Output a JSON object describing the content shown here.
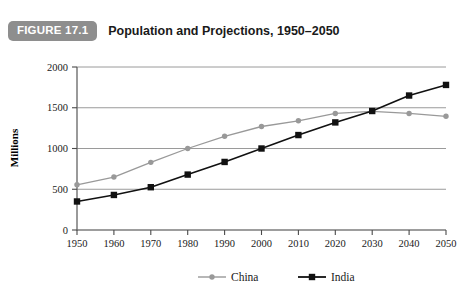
{
  "header": {
    "badge_label": "FIGURE 17.1",
    "title": "Population and Projections, 1950–2050",
    "badge_color": "#8e8e8e",
    "badge_text_color": "#ffffff"
  },
  "chart_data": {
    "type": "line",
    "title": "Population and Projections, 1950–2050",
    "xlabel": "",
    "ylabel": "Millions",
    "categories": [
      "1950",
      "1960",
      "1970",
      "1980",
      "1990",
      "2000",
      "2010",
      "2020",
      "2030",
      "2040",
      "2050"
    ],
    "x": [
      1950,
      1960,
      1970,
      1980,
      1990,
      2000,
      2010,
      2020,
      2030,
      2040,
      2050
    ],
    "series": [
      {
        "name": "China",
        "color": "#999999",
        "marker": "circle",
        "values": [
          555,
          650,
          830,
          1000,
          1150,
          1270,
          1340,
          1430,
          1455,
          1430,
          1395
        ]
      },
      {
        "name": "India",
        "color": "#111111",
        "marker": "square",
        "values": [
          350,
          430,
          525,
          680,
          835,
          1000,
          1165,
          1320,
          1460,
          1650,
          1780
        ]
      }
    ],
    "ylim": [
      0,
      2000
    ],
    "yticks": [
      0,
      500,
      1000,
      1500,
      2000
    ],
    "ytick_labels": [
      "0",
      "500",
      "1000",
      "1500",
      "2000"
    ],
    "xtick_labels": [
      "1950",
      "1960",
      "1970",
      "1980",
      "1990",
      "2000",
      "2010",
      "2020",
      "2030",
      "2040",
      "2050"
    ],
    "grid": true,
    "grid_color": "#9a9a9a",
    "legend_position": "bottom",
    "legend": [
      "China",
      "India"
    ]
  }
}
